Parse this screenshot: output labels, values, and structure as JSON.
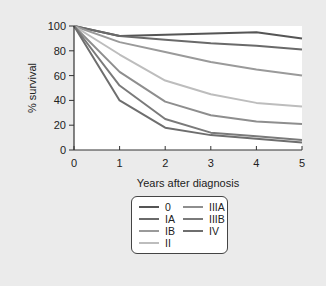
{
  "chart_data": {
    "type": "line",
    "title": "",
    "xlabel": "Years after diagnosis",
    "ylabel": "% survival",
    "xlim": [
      0,
      5
    ],
    "ylim": [
      0,
      100
    ],
    "x": [
      0,
      1,
      2,
      3,
      4,
      5
    ],
    "xticks": [
      "0",
      "1",
      "2",
      "3",
      "4",
      "5"
    ],
    "yticks": [
      "0",
      "20",
      "40",
      "60",
      "80",
      "100"
    ],
    "grid": false,
    "legend_position": "below",
    "series": [
      {
        "name": "0",
        "color": "#555555",
        "values": [
          100,
          92,
          93,
          94,
          95,
          90
        ]
      },
      {
        "name": "IA",
        "color": "#6a6a6a",
        "values": [
          100,
          92,
          89,
          86,
          84,
          81
        ]
      },
      {
        "name": "IB",
        "color": "#9a9a9a",
        "values": [
          100,
          87,
          79,
          71,
          65,
          60
        ]
      },
      {
        "name": "II",
        "color": "#bdbdbd",
        "values": [
          100,
          77,
          56,
          45,
          38,
          35
        ]
      },
      {
        "name": "IIIA",
        "color": "#8e8e8e",
        "values": [
          100,
          63,
          39,
          28,
          23,
          21
        ]
      },
      {
        "name": "IIIB",
        "color": "#7a7a7a",
        "values": [
          100,
          52,
          25,
          14,
          11,
          8
        ]
      },
      {
        "name": "IV",
        "color": "#6e6e6e",
        "values": [
          100,
          40,
          18,
          12,
          9,
          6
        ]
      }
    ]
  },
  "legend": {
    "items": [
      {
        "label": "0"
      },
      {
        "label": "IA"
      },
      {
        "label": "IB"
      },
      {
        "label": "II"
      },
      {
        "label": "IIIA"
      },
      {
        "label": "IIIB"
      },
      {
        "label": "IV"
      }
    ]
  }
}
